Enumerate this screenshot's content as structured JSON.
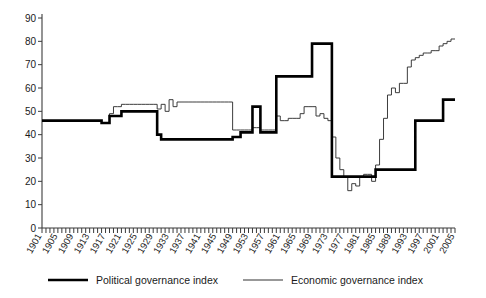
{
  "chart_data": {
    "type": "line",
    "title": "",
    "xlabel": "",
    "ylabel": "",
    "xlim": [
      1901,
      2005
    ],
    "ylim": [
      0,
      90
    ],
    "ytick_step": 10,
    "yticks": [
      0,
      10,
      20,
      30,
      40,
      50,
      60,
      70,
      80,
      90
    ],
    "xtick_step": 4,
    "xticks": [
      1901,
      1905,
      1909,
      1913,
      1917,
      1921,
      1925,
      1929,
      1933,
      1937,
      1941,
      1945,
      1949,
      1953,
      1957,
      1961,
      1965,
      1969,
      1973,
      1977,
      1981,
      1985,
      1989,
      1993,
      1997,
      2001,
      2005
    ],
    "minor_xticks_every_year": true,
    "grid": false,
    "legend_position": "bottom",
    "x": [
      1901,
      1902,
      1903,
      1904,
      1905,
      1906,
      1907,
      1908,
      1909,
      1910,
      1911,
      1912,
      1913,
      1914,
      1915,
      1916,
      1917,
      1918,
      1919,
      1920,
      1921,
      1922,
      1923,
      1924,
      1925,
      1926,
      1927,
      1928,
      1929,
      1930,
      1931,
      1932,
      1933,
      1934,
      1935,
      1936,
      1937,
      1938,
      1939,
      1940,
      1941,
      1942,
      1943,
      1944,
      1945,
      1946,
      1947,
      1948,
      1949,
      1950,
      1951,
      1952,
      1953,
      1954,
      1955,
      1956,
      1957,
      1958,
      1959,
      1960,
      1961,
      1962,
      1963,
      1964,
      1965,
      1966,
      1967,
      1968,
      1969,
      1970,
      1971,
      1972,
      1973,
      1974,
      1975,
      1976,
      1977,
      1978,
      1979,
      1980,
      1981,
      1982,
      1983,
      1984,
      1985,
      1986,
      1987,
      1988,
      1989,
      1990,
      1991,
      1992,
      1993,
      1994,
      1995,
      1996,
      1997,
      1998,
      1999,
      2000,
      2001,
      2002,
      2003,
      2004,
      2005
    ],
    "series": [
      {
        "name": "Political governance index",
        "style": "thick-black",
        "color": "#000000",
        "values": [
          46,
          46,
          46,
          46,
          46,
          46,
          46,
          46,
          46,
          46,
          46,
          46,
          46,
          46,
          46,
          45,
          45,
          48,
          48,
          48,
          50,
          50,
          50,
          50,
          50,
          50,
          50,
          50,
          50,
          40,
          38,
          38,
          38,
          38,
          38,
          38,
          38,
          38,
          38,
          38,
          38,
          38,
          38,
          38,
          38,
          38,
          38,
          38,
          39,
          39,
          41,
          41,
          41,
          52,
          52,
          41,
          41,
          41,
          41,
          65,
          65,
          65,
          65,
          65,
          65,
          65,
          65,
          65,
          79,
          79,
          79,
          79,
          79,
          22,
          22,
          22,
          22,
          22,
          22,
          22,
          22,
          22,
          22,
          22,
          25,
          25,
          25,
          25,
          25,
          25,
          25,
          25,
          25,
          25,
          46,
          46,
          46,
          46,
          46,
          46,
          46,
          55,
          55,
          55,
          55
        ]
      },
      {
        "name": "Economic governance index",
        "style": "thin-black",
        "color": "#333333",
        "values": [
          46,
          46,
          46,
          46,
          46,
          46,
          46,
          46,
          46,
          46,
          46,
          46,
          46,
          46,
          46,
          45,
          45,
          49,
          52,
          52,
          53,
          53,
          53,
          53,
          53,
          53,
          53,
          53,
          53,
          51,
          53,
          50,
          55,
          52,
          54,
          54,
          54,
          54,
          54,
          54,
          54,
          54,
          54,
          54,
          54,
          54,
          54,
          54,
          42,
          42,
          42,
          42,
          42,
          43,
          43,
          42,
          42,
          42,
          42,
          48,
          46,
          46,
          47,
          47,
          47,
          49,
          52,
          52,
          52,
          48,
          49,
          47,
          46,
          39,
          30,
          25,
          22,
          16,
          19,
          18,
          22,
          23,
          23,
          20,
          27,
          38,
          47,
          57,
          60,
          58,
          62,
          62,
          69,
          72,
          73,
          74,
          75,
          75,
          76,
          76,
          78,
          79,
          80,
          81,
          81
        ]
      }
    ]
  },
  "legend": {
    "entries": [
      {
        "label": "Political governance index",
        "swatch": "thick-line-swatch"
      },
      {
        "label": "Economic governance index",
        "swatch": "thin-line-swatch"
      }
    ]
  },
  "axes": {
    "y_axis_name": "value-axis",
    "x_axis_name": "year-axis"
  }
}
